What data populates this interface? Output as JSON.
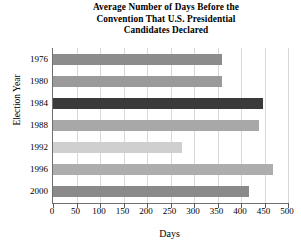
{
  "chart_data": {
    "type": "bar",
    "orientation": "horizontal",
    "title": "Average Number of Days Before the Convention That U.S. Presidential Candidates Declared",
    "title_lines": [
      "Average Number of Days Before the",
      "Convention That U.S. Presidential",
      "Candidates Declared"
    ],
    "xlabel": "Days",
    "ylabel": "Election Year",
    "categories": [
      "1976",
      "1980",
      "1984",
      "1988",
      "1992",
      "1996",
      "2000"
    ],
    "values": [
      360,
      360,
      447,
      438,
      275,
      468,
      417
    ],
    "bar_colors": [
      "#8c8c8c",
      "#9a9a9a",
      "#3a3a3a",
      "#a8a8a8",
      "#cfcfcf",
      "#adadad",
      "#8a8a8a"
    ],
    "xlim": [
      0,
      500
    ],
    "xticks": [
      0,
      50,
      100,
      150,
      200,
      250,
      300,
      350,
      400,
      450,
      500
    ],
    "xtick_labels": [
      "0",
      "50",
      "100",
      "150",
      "200",
      "250",
      "300",
      "350",
      "400",
      "450",
      "500"
    ],
    "grid": "vertical",
    "gridline_color": "#d8d8d8",
    "axis_color": "#6f6f6f",
    "legend": "none",
    "background": "#ffffff"
  }
}
